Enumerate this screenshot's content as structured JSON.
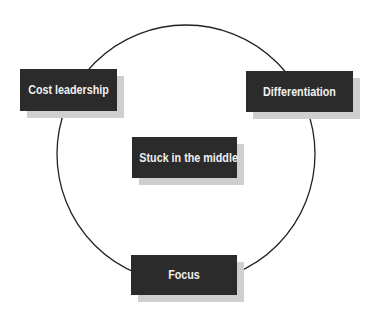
{
  "diagram": {
    "type": "cycle",
    "colors": {
      "box_fill": "#2b2b2b",
      "box_text": "#f0f0f0",
      "shadow": "#cfcfcf",
      "ring_stroke": "#222222",
      "background": "#ffffff"
    },
    "nodes": [
      {
        "id": "cost-leadership",
        "label": "Cost leadership"
      },
      {
        "id": "differentiation",
        "label": "Differentiation"
      },
      {
        "id": "stuck-in-the-middle",
        "label": "Stuck in the middle"
      },
      {
        "id": "focus",
        "label": "Focus"
      }
    ],
    "ring_connects": [
      "cost-leadership",
      "differentiation",
      "focus"
    ],
    "center_node": "stuck-in-the-middle"
  }
}
